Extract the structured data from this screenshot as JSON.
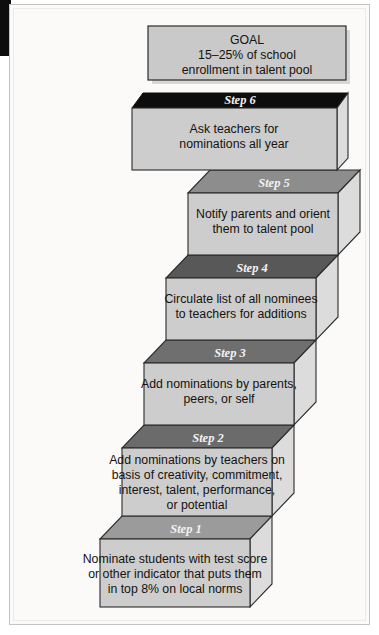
{
  "diagram": {
    "title_box": {
      "name": "goal-box",
      "lines": [
        "GOAL",
        "15–25% of school",
        "enrollment in talent pool"
      ],
      "fill": "#c9c9c9",
      "stroke": "#2b2b2b"
    },
    "staircase": {
      "front_fill": "#cdcdcd",
      "side_fill": "#dcdcdc",
      "stroke": "#2b2b2b",
      "label_color": "#f2f2f2",
      "steps": [
        {
          "id": "step-6",
          "label": "Step 6",
          "top_fill": "#0d0d0d",
          "lines": [
            "Ask teachers for",
            "nominations all year"
          ]
        },
        {
          "id": "step-5",
          "label": "Step 5",
          "top_fill": "#8d8d8d",
          "lines": [
            "Notify parents and orient",
            "them to talent pool"
          ]
        },
        {
          "id": "step-4",
          "label": "Step 4",
          "top_fill": "#585858",
          "lines": [
            "Circulate list of all nominees",
            "to teachers for additions"
          ]
        },
        {
          "id": "step-3",
          "label": "Step 3",
          "top_fill": "#6f6f6f",
          "lines": [
            "Add nominations by parents,",
            "peers, or self"
          ]
        },
        {
          "id": "step-2",
          "label": "Step 2",
          "top_fill": "#6b6b6b",
          "lines": [
            "Add nominations by teachers on",
            "basis of creativity, commitment,",
            "interest, talent, performance,",
            "or potential"
          ]
        },
        {
          "id": "step-1",
          "label": "Step 1",
          "top_fill": "#9b9b9b",
          "lines": [
            "Nominate students with test score",
            "or other indicator that puts them",
            "in top 8% on local norms"
          ]
        }
      ]
    }
  }
}
